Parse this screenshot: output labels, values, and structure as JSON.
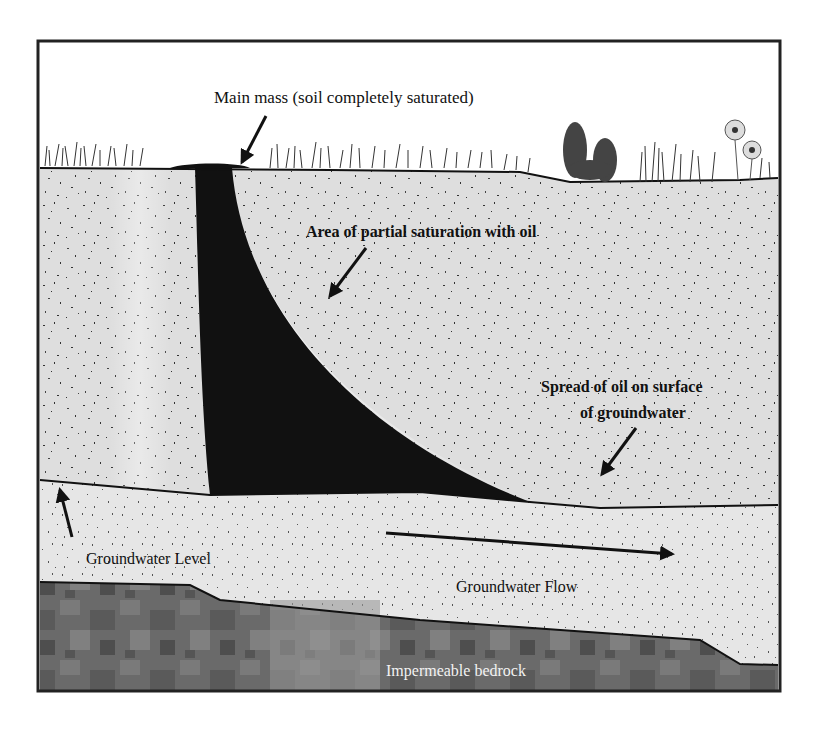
{
  "diagram": {
    "title": "",
    "labels": {
      "main_mass": "Main mass (soil completely saturated)",
      "partial_saturation": "Area of partial saturation with oil",
      "spread_line1": "Spread of oil on surface",
      "spread_line2": "of groundwater",
      "groundwater_level": "Groundwater Level",
      "groundwater_flow": "Groundwater Flow",
      "bedrock": "Impermeable bedrock"
    },
    "layers": [
      {
        "name": "sky",
        "color": "#ffffff"
      },
      {
        "name": "unsaturated-soil",
        "color": "#dcdcdc"
      },
      {
        "name": "oil-plume",
        "color": "#111111"
      },
      {
        "name": "groundwater-zone",
        "color": "#e4e4e4"
      },
      {
        "name": "bedrock",
        "color": "#6e6e6e"
      }
    ],
    "arrows": [
      {
        "name": "main-mass-arrow"
      },
      {
        "name": "partial-saturation-arrow"
      },
      {
        "name": "spread-arrow"
      },
      {
        "name": "groundwater-level-arrow"
      },
      {
        "name": "groundwater-flow-arrow"
      }
    ]
  }
}
